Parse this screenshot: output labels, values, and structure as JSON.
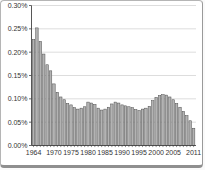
{
  "chart_data": {
    "type": "bar",
    "title": "",
    "xlabel": "",
    "ylabel": "",
    "x": [
      1964,
      1965,
      1966,
      1967,
      1968,
      1969,
      1970,
      1971,
      1972,
      1973,
      1974,
      1975,
      1976,
      1977,
      1978,
      1979,
      1980,
      1981,
      1982,
      1983,
      1984,
      1985,
      1986,
      1987,
      1988,
      1989,
      1990,
      1991,
      1992,
      1993,
      1994,
      1995,
      1996,
      1997,
      1998,
      1999,
      2000,
      2001,
      2002,
      2003,
      2004,
      2005,
      2006,
      2007,
      2008,
      2009,
      2010,
      2011
    ],
    "values": [
      0.227,
      0.252,
      0.223,
      0.196,
      0.173,
      0.16,
      0.132,
      0.114,
      0.104,
      0.098,
      0.09,
      0.087,
      0.081,
      0.078,
      0.08,
      0.083,
      0.093,
      0.091,
      0.088,
      0.08,
      0.076,
      0.078,
      0.082,
      0.089,
      0.093,
      0.091,
      0.087,
      0.085,
      0.083,
      0.081,
      0.077,
      0.075,
      0.078,
      0.08,
      0.084,
      0.096,
      0.103,
      0.107,
      0.109,
      0.108,
      0.104,
      0.098,
      0.09,
      0.082,
      0.073,
      0.064,
      0.053,
      0.037
    ],
    "value_unit": "%",
    "ylim": [
      0,
      0.3
    ],
    "ytick_step": 0.05,
    "ytick_labels": [
      "0.00%",
      "0.05%",
      "0.10%",
      "0.15%",
      "0.20%",
      "0.25%",
      "0.30%"
    ],
    "xtick_labels": [
      "1964",
      "1970",
      "1975",
      "1980",
      "1985",
      "1990",
      "1995",
      "2000",
      "2005",
      "2011"
    ],
    "grid": true,
    "legend_position": "none",
    "colors": {
      "bar_fill": "#b3b3b3",
      "bar_stroke": "#4d4d4d",
      "grid_color": "#d4d4d4",
      "axis_color": "#444444",
      "text_color": "#333333",
      "background": "#ffffff",
      "card_border": "#9a9a9a"
    }
  }
}
